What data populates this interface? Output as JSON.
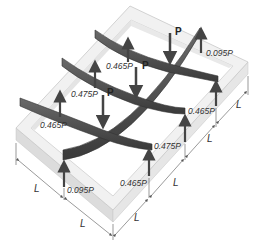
{
  "figure": {
    "colors": {
      "frame_top": "#efefef",
      "frame_side": "#d9d9d9",
      "frame_edge": "#c4c4c4",
      "beam": "#4a4a4a",
      "beam_light": "#6a6a6a",
      "arrow": "#444444",
      "dimension_line": "#555555"
    },
    "loads": [
      {
        "id": "load-1",
        "label": "P"
      },
      {
        "id": "load-2",
        "label": "P"
      },
      {
        "id": "load-3",
        "label": "P"
      }
    ],
    "reactions": [
      {
        "id": "reaction-back-top",
        "label": "0.095P"
      },
      {
        "id": "reaction-back-mid",
        "label": "0.465P"
      },
      {
        "id": "reaction-left-mid",
        "label": "0.475P"
      },
      {
        "id": "reaction-left-front",
        "label": "0.465P"
      },
      {
        "id": "reaction-right-back",
        "label": "0.465P"
      },
      {
        "id": "reaction-right-mid",
        "label": "0.475P"
      },
      {
        "id": "reaction-front-right",
        "label": "0.465P"
      },
      {
        "id": "reaction-front-left",
        "label": "0.095P"
      }
    ],
    "dimensions": {
      "left_side": [
        "L",
        "L"
      ],
      "right_side": [
        "L",
        "L",
        "L"
      ]
    }
  }
}
